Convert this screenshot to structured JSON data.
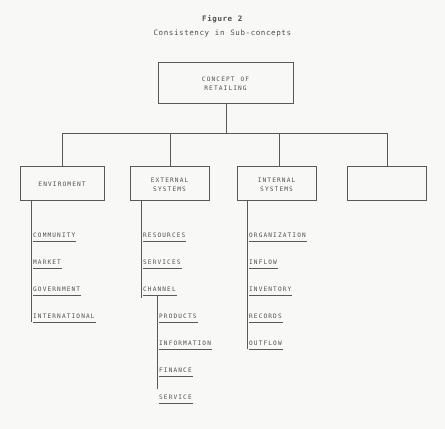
{
  "figure": {
    "title": "Figure 2",
    "subtitle": "Consistency in Sub-concepts"
  },
  "root": {
    "label": "CONCEPT OF\nRETAILING"
  },
  "branches": [
    {
      "label": "ENVIROMENT",
      "items": [
        "COMMUNITY",
        "MARKET",
        "GOVERNMENT",
        "INTERNATIONAL"
      ]
    },
    {
      "label": "EXTERNAL\nSYSTEMS",
      "items": [
        "RESOURCES",
        "SERVICES",
        "CHANNEL"
      ],
      "sub_items": [
        "PRODUCTS",
        "INFORMATION",
        "FINANCE",
        "SERVICE"
      ]
    },
    {
      "label": "INTERNAL\nSYSTEMS",
      "items": [
        "ORGANIZATION",
        "INFLOW",
        "INVENTORY",
        "RECORDS",
        "OUTFLOW"
      ]
    },
    {
      "label": "",
      "items": []
    }
  ],
  "colors": {
    "ink": "#4d4d49",
    "rule": "#55554f",
    "paper": "#fdfdfc"
  }
}
